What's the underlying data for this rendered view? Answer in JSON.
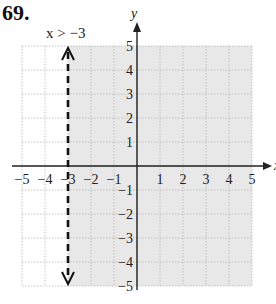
{
  "problem": {
    "number": "69."
  },
  "chart_data": {
    "type": "line",
    "title": "",
    "annotation": "x > −3",
    "xlabel": "x",
    "ylabel": "y",
    "xlim": [
      -5,
      5
    ],
    "ylim": [
      -5,
      5
    ],
    "grid": true,
    "x_ticks": [
      "−5",
      "−4",
      "−3",
      "−2",
      "−1",
      "1",
      "2",
      "3",
      "4",
      "5"
    ],
    "y_ticks": [
      "5",
      "4",
      "3",
      "2",
      "1",
      "−1",
      "−2",
      "−3",
      "−4",
      "−5"
    ],
    "boundary": {
      "type": "vertical",
      "x": -3,
      "style": "dashed",
      "arrows": "both"
    },
    "shaded_region": {
      "condition": "x > -3",
      "color": "#e6e6e6"
    }
  },
  "colors": {
    "shade": "#e8e8e8",
    "grid": "#b8b8b8",
    "axis": "#222222",
    "boundary": "#111111"
  }
}
